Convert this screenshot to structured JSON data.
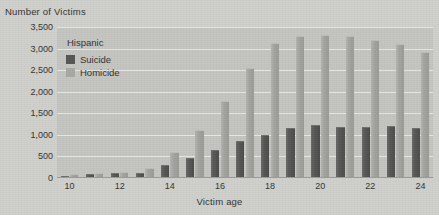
{
  "chart_data": {
    "type": "bar",
    "title": "",
    "ylabel": "Number of Victims",
    "xlabel": "Victim age",
    "legend_title": "Hispanic",
    "legend_position": "upper-left-inside",
    "grid": true,
    "ylim": [
      0,
      3500
    ],
    "yticks": [
      0,
      500,
      1000,
      1500,
      2000,
      2500,
      3000,
      3500
    ],
    "ytick_labels": [
      "0",
      "500",
      "1,000",
      "1,500",
      "2,000",
      "2,500",
      "3,000",
      "3,500"
    ],
    "categories": [
      10,
      11,
      12,
      13,
      14,
      15,
      16,
      17,
      18,
      19,
      20,
      21,
      22,
      23,
      24
    ],
    "xtick_labels": [
      "10",
      "12",
      "14",
      "16",
      "18",
      "20",
      "22",
      "24"
    ],
    "xtick_values": [
      10,
      12,
      14,
      16,
      18,
      20,
      22,
      24
    ],
    "series": [
      {
        "name": "Suicide",
        "color": "#565654",
        "values": [
          30,
          60,
          85,
          95,
          290,
          440,
          620,
          830,
          980,
          1130,
          1210,
          1150,
          1160,
          1180,
          1140
        ]
      },
      {
        "name": "Homicide",
        "color": "#a8a8a4",
        "values": [
          70,
          95,
          120,
          205,
          590,
          1100,
          1760,
          2520,
          3110,
          3260,
          3300,
          3270,
          3180,
          3080,
          2900
        ]
      }
    ]
  },
  "colors": {
    "page_background": "#cfcfcb",
    "plot_background": "#c4c4c0",
    "gridline": "#e6e6e2",
    "text": "#343434",
    "suicide": "#565654",
    "homicide": "#a8a8a4"
  }
}
